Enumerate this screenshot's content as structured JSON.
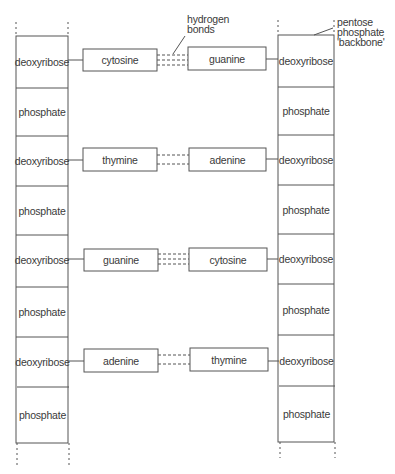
{
  "diagram": {
    "type": "DNA double helix schematic (flattened ladder)",
    "left_strand": [
      "deoxyribose",
      "phosphate",
      "deoxyribose",
      "phosphate",
      "deoxyribose",
      "phosphate",
      "deoxyribose",
      "phosphate"
    ],
    "right_strand": [
      "deoxyribose",
      "phosphate",
      "deoxyribose",
      "phosphate",
      "deoxyribose",
      "phosphate",
      "deoxyribose",
      "phosphate"
    ],
    "base_pairs": [
      {
        "left": "cytosine",
        "right": "guanine",
        "hydrogen_bonds": 3
      },
      {
        "left": "thymine",
        "right": "adenine",
        "hydrogen_bonds": 2
      },
      {
        "left": "guanine",
        "right": "cytosine",
        "hydrogen_bonds": 3
      },
      {
        "left": "adenine",
        "right": "thymine",
        "hydrogen_bonds": 2
      }
    ],
    "annotations": {
      "hydrogen_bonds_line1": "hydrogen",
      "hydrogen_bonds_line2": "bonds",
      "backbone_line1": "pentose",
      "backbone_line2": "phosphate",
      "backbone_line3": "'backbone'"
    },
    "colors": {
      "line": "#555555",
      "text": "#3a3a3a",
      "background": "#ffffff"
    }
  }
}
